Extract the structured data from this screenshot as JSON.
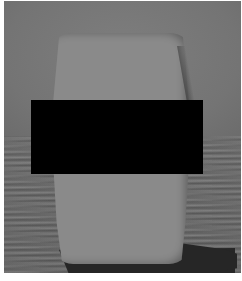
{
  "image": {
    "description": "Grayscale 3D render of a rounded box-shaped object standing on a textured floor, casting a dark shadow; middle region obscured by a black redaction rectangle",
    "colors": {
      "background_wall": "#767676",
      "floor": "#6a6a6a",
      "object": "#8a8a8a",
      "shadow": "#262626",
      "redaction": "#000000",
      "border": "#ffffff"
    }
  }
}
